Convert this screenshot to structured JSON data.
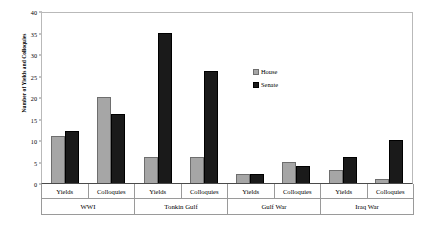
{
  "chart_data": {
    "type": "bar",
    "title": "",
    "xlabel": "",
    "ylabel": "Number of Yields and Colloquies",
    "ylim": [
      0,
      40
    ],
    "yticks": [
      0,
      5,
      10,
      15,
      20,
      25,
      30,
      35,
      40
    ],
    "grid": false,
    "legend_position": "inside-upper-right",
    "categories": [
      "Yields",
      "Colloquies",
      "Yields",
      "Colloquies",
      "Yields",
      "Colloquies",
      "Yields",
      "Colloquies"
    ],
    "groups": [
      "WWI",
      "Tonkin Gulf",
      "Gulf War",
      "Iraq War"
    ],
    "series": [
      {
        "name": "House",
        "color": "#a6a6a6",
        "values": [
          11,
          20,
          6,
          6,
          2,
          5,
          3,
          1
        ]
      },
      {
        "name": "Senate",
        "color": "#1a1a1a",
        "values": [
          12,
          16,
          35,
          26,
          2,
          4,
          6,
          10
        ]
      }
    ]
  },
  "legend": {
    "items": [
      {
        "label": "House",
        "swatch": "house-swatch"
      },
      {
        "label": "Senate",
        "swatch": "senate-swatch"
      }
    ]
  }
}
